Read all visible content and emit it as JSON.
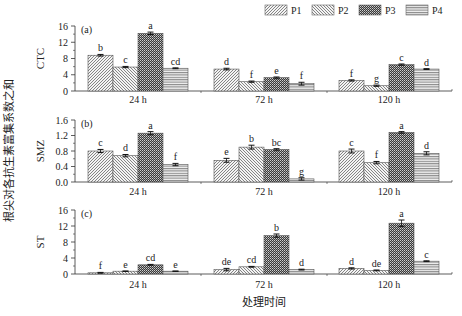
{
  "figure": {
    "y_title": "根尖对各抗生素富集系数之和",
    "x_title": "处理时间"
  },
  "legend": [
    {
      "name": "P1",
      "pattern": "diag-right"
    },
    {
      "name": "P2",
      "pattern": "diag-left"
    },
    {
      "name": "P3",
      "pattern": "dense-check"
    },
    {
      "name": "P4",
      "pattern": "horizontal"
    }
  ],
  "chart_data": [
    {
      "type": "bar",
      "panel": "(a)",
      "title": "",
      "ylabel": "CTC",
      "xlabel": "",
      "categories": [
        "24 h",
        "72 h",
        "120 h"
      ],
      "ylim": [
        0,
        16
      ],
      "yticks": [
        0,
        4,
        8,
        12,
        16
      ],
      "series": [
        {
          "name": "P1",
          "values": [
            8.8,
            5.4,
            2.6
          ],
          "errors": [
            0.2,
            0.2,
            0.15
          ],
          "letters": [
            "b",
            "d",
            "f"
          ]
        },
        {
          "name": "P2",
          "values": [
            5.9,
            2.3,
            1.3
          ],
          "errors": [
            0.15,
            0.15,
            0.15
          ],
          "letters": [
            "c",
            "f",
            "g"
          ]
        },
        {
          "name": "P3",
          "values": [
            14.2,
            3.3,
            6.5
          ],
          "errors": [
            0.3,
            0.15,
            0.15
          ],
          "letters": [
            "a",
            "e",
            "c"
          ]
        },
        {
          "name": "P4",
          "values": [
            5.6,
            1.8,
            5.4
          ],
          "errors": [
            0.1,
            0.35,
            0.1
          ],
          "letters": [
            "cd",
            "f",
            "d"
          ]
        }
      ],
      "grid": false,
      "legend_position": "top-right"
    },
    {
      "type": "bar",
      "panel": "(b)",
      "title": "",
      "ylabel": "SMZ",
      "xlabel": "",
      "categories": [
        "24 h",
        "72 h",
        "120 h"
      ],
      "ylim": [
        0,
        1.6
      ],
      "yticks": [
        0.0,
        0.4,
        0.8,
        1.2,
        1.6
      ],
      "series": [
        {
          "name": "P1",
          "values": [
            0.8,
            0.56,
            0.8
          ],
          "errors": [
            0.04,
            0.05,
            0.05
          ],
          "letters": [
            "c",
            "e",
            "c"
          ]
        },
        {
          "name": "P2",
          "values": [
            0.68,
            0.9,
            0.5
          ],
          "errors": [
            0.03,
            0.05,
            0.03
          ],
          "letters": [
            "d",
            "b",
            "f"
          ]
        },
        {
          "name": "P3",
          "values": [
            1.26,
            0.84,
            1.28
          ],
          "errors": [
            0.04,
            0.02,
            0.02
          ],
          "letters": [
            "a",
            "bc",
            "a"
          ]
        },
        {
          "name": "P4",
          "values": [
            0.45,
            0.08,
            0.74
          ],
          "errors": [
            0.03,
            0.03,
            0.04
          ],
          "letters": [
            "f",
            "g",
            "d"
          ]
        }
      ],
      "grid": false
    },
    {
      "type": "bar",
      "panel": "(c)",
      "title": "",
      "ylabel": "ST",
      "xlabel": "处理时间",
      "categories": [
        "24 h",
        "72 h",
        "120 h"
      ],
      "ylim": [
        0,
        16
      ],
      "yticks": [
        0,
        4,
        8,
        12,
        16
      ],
      "series": [
        {
          "name": "P1",
          "values": [
            0.3,
            1.1,
            1.4
          ],
          "errors": [
            0.1,
            0.3,
            0.15
          ],
          "letters": [
            "f",
            "de",
            "d"
          ]
        },
        {
          "name": "P2",
          "values": [
            0.7,
            1.8,
            0.9
          ],
          "errors": [
            0.05,
            0.1,
            0.1
          ],
          "letters": [
            "e",
            "cd",
            "de"
          ]
        },
        {
          "name": "P3",
          "values": [
            2.3,
            9.6,
            12.7
          ],
          "errors": [
            0.1,
            0.4,
            0.8
          ],
          "letters": [
            "cd",
            "b",
            "a"
          ]
        },
        {
          "name": "P4",
          "values": [
            0.7,
            1.1,
            3.2
          ],
          "errors": [
            0.05,
            0.1,
            0.1
          ],
          "letters": [
            "e",
            "d",
            "c"
          ]
        }
      ],
      "grid": false
    }
  ]
}
